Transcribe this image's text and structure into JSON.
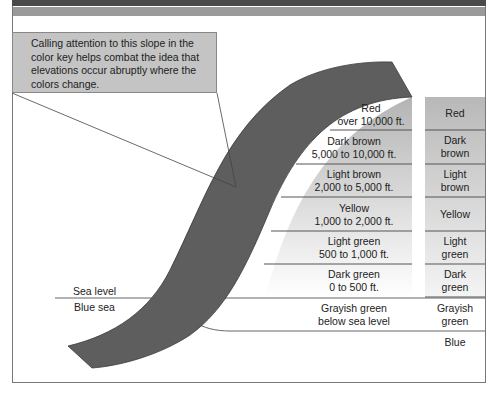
{
  "callout": {
    "text": "Calling attention to this slope in the color key helps combat the idea that elevations occur abruptly where the colors change."
  },
  "labels": {
    "sea_level": "Sea level",
    "blue_sea": "Blue sea"
  },
  "key_rows": [
    {
      "name": "Red",
      "range": "over 10,000 ft.",
      "short": "Red",
      "short2": ""
    },
    {
      "name": "Dark brown",
      "range": "5,000 to 10,000 ft.",
      "short": "Dark",
      "short2": "brown"
    },
    {
      "name": "Light brown",
      "range": "2,000 to 5,000 ft.",
      "short": "Light",
      "short2": "brown"
    },
    {
      "name": "Yellow",
      "range": "1,000 to 2,000 ft.",
      "short": "Yellow",
      "short2": ""
    },
    {
      "name": "Light green",
      "range": "500 to 1,000 ft.",
      "short": "Light",
      "short2": "green"
    },
    {
      "name": "Dark green",
      "range": "0 to 500 ft.",
      "short": "Dark",
      "short2": "green"
    },
    {
      "name": "Grayish green",
      "range": "below sea level",
      "short": "Grayish",
      "short2": "green"
    },
    {
      "name": "",
      "range": "",
      "short": "Blue",
      "short2": ""
    }
  ],
  "colors": {
    "slope_band": "#5e5e5e",
    "key_top": "#b8b8b8",
    "key_bottom": "#ffffff",
    "callout_bg": "#c4c4c4",
    "frame": "#777777"
  }
}
